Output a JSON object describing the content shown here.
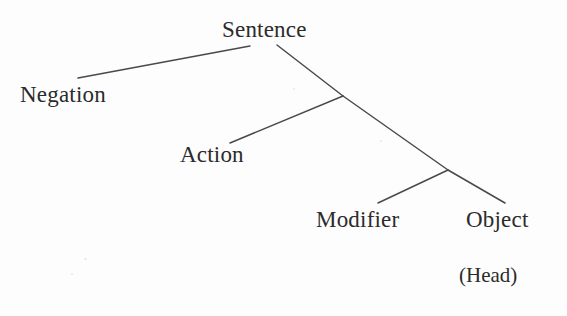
{
  "diagram": {
    "type": "parse-tree",
    "background_color": "#fdfdfd",
    "line_color": "#4a4a4a",
    "text_color": "#2b2b2b",
    "nodes": [
      {
        "id": "sentence",
        "label": "Sentence",
        "x": 222,
        "y": 18
      },
      {
        "id": "negation",
        "label": "Negation",
        "x": 20,
        "y": 83
      },
      {
        "id": "action",
        "label": "Action",
        "x": 180,
        "y": 143
      },
      {
        "id": "modifier",
        "label": "Modifier",
        "x": 316,
        "y": 208
      },
      {
        "id": "object",
        "label": "Object",
        "x": 466,
        "y": 208
      }
    ],
    "annotations": [
      {
        "id": "head",
        "label": "(Head)",
        "x": 459,
        "y": 265
      }
    ],
    "edges": [
      {
        "id": "sentence-negation",
        "from": [
          250,
          46
        ],
        "to": [
          78,
          78
        ]
      },
      {
        "id": "sentence-junction1",
        "from": [
          277,
          45
        ],
        "to": [
          343,
          96
        ]
      },
      {
        "id": "junction1-action",
        "from": [
          343,
          96
        ],
        "to": [
          230,
          143
        ]
      },
      {
        "id": "junction1-junction2",
        "from": [
          343,
          96
        ],
        "to": [
          448,
          170
        ]
      },
      {
        "id": "junction2-modifier",
        "from": [
          448,
          170
        ],
        "to": [
          378,
          203
        ]
      },
      {
        "id": "junction2-object",
        "from": [
          448,
          170
        ],
        "to": [
          505,
          203
        ]
      }
    ]
  }
}
